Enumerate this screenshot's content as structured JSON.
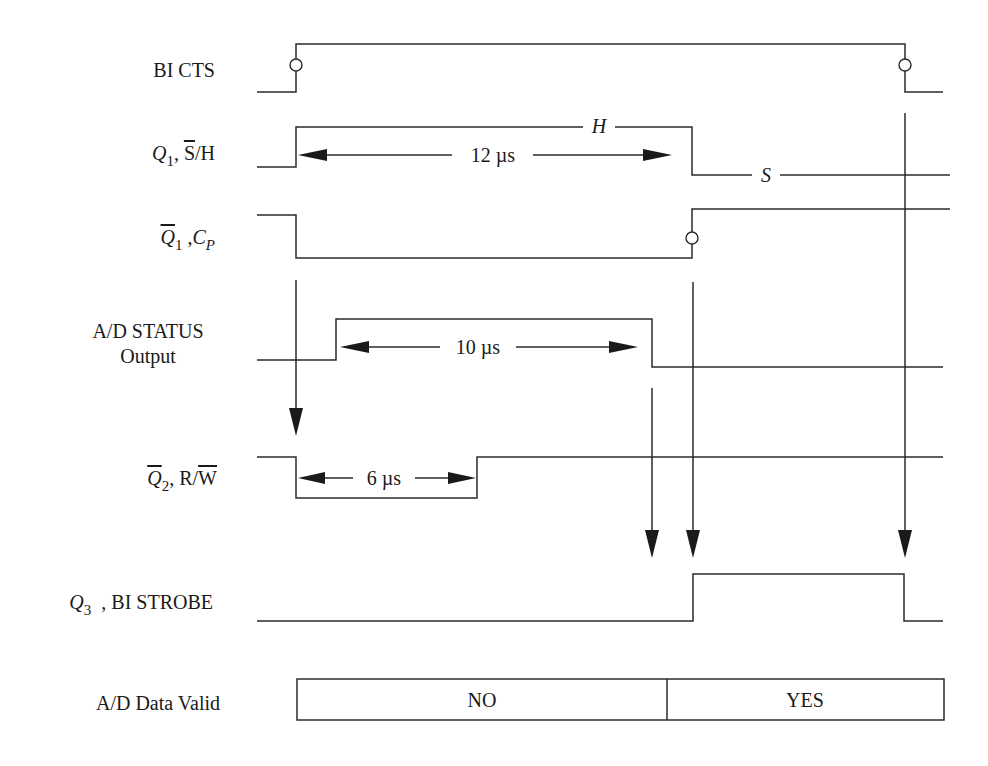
{
  "diagram": {
    "type": "timing-diagram",
    "signals": {
      "bi_cts": {
        "label": "BI CTS"
      },
      "q1": {
        "name": "Q",
        "sub": "1",
        "sep": ", ",
        "over": "S",
        "rest": "/H",
        "high_level": "H",
        "low_level": "S"
      },
      "q1_bar": {
        "name": "Q",
        "sub": "1",
        "sep": " ,",
        "name2": "C",
        "sub2": "P"
      },
      "ad_status": {
        "line1": "A/D STATUS",
        "line2": "Output"
      },
      "q2_bar": {
        "name": "Q",
        "sub": "2",
        "sep": ", R/",
        "over": "W"
      },
      "q3": {
        "name": "Q",
        "sub": "3",
        "rest": "  , BI STROBE"
      },
      "data_valid": {
        "label": "A/D Data Valid",
        "state_1": "NO",
        "state_2": "YES"
      }
    },
    "timings": {
      "q1_pulse": "12 µs",
      "ad_status_pulse": "10 µs",
      "q2_pulse": "6 µs"
    },
    "colors": {
      "line": "#2b2b2b",
      "text": "#1a1a1a",
      "background": "#ffffff"
    }
  }
}
